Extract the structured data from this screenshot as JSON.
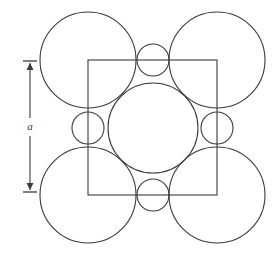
{
  "figure": {
    "background_color": "#ffffff",
    "stroke_color": "#3a3a3a",
    "width": 277,
    "height": 254
  },
  "dimension": {
    "label": "a",
    "label_x": 30,
    "label_y": 127,
    "axis_x": 30,
    "top_y": 61,
    "bottom_y": 192,
    "tick_half_width": 7,
    "arrow_half_width": 3.5,
    "arrow_length": 7
  },
  "unit_cell": {
    "name": "unit-cell-square",
    "x": 88,
    "y": 60,
    "width": 129,
    "height": 135
  },
  "chart_data": {
    "type": "scatter",
    "xlabel": "",
    "ylabel": "",
    "annotations": [
      {
        "text": "a",
        "x": 30,
        "y": 127,
        "role": "lattice-parameter-label"
      }
    ],
    "legend": [],
    "grid": false,
    "shapes": [
      {
        "name": "corner-circle-top-left",
        "type": "circle",
        "cx": 88,
        "cy": 60,
        "r": 48
      },
      {
        "name": "corner-circle-top-right",
        "type": "circle",
        "cx": 217,
        "cy": 60,
        "r": 48
      },
      {
        "name": "corner-circle-bottom-left",
        "type": "circle",
        "cx": 88,
        "cy": 195,
        "r": 48
      },
      {
        "name": "corner-circle-bottom-right",
        "type": "circle",
        "cx": 217,
        "cy": 195,
        "r": 48
      },
      {
        "name": "edge-circle-top",
        "type": "circle",
        "cx": 153,
        "cy": 60,
        "r": 16
      },
      {
        "name": "edge-circle-bottom",
        "type": "circle",
        "cx": 153,
        "cy": 195,
        "r": 16
      },
      {
        "name": "edge-circle-left",
        "type": "circle",
        "cx": 88,
        "cy": 128,
        "r": 16
      },
      {
        "name": "edge-circle-right",
        "type": "circle",
        "cx": 217,
        "cy": 128,
        "r": 16
      },
      {
        "name": "center-circle",
        "type": "circle",
        "cx": 153,
        "cy": 128,
        "r": 45
      },
      {
        "name": "unit-cell-square",
        "type": "rect",
        "x": 88,
        "y": 60,
        "width": 129,
        "height": 135
      }
    ]
  }
}
